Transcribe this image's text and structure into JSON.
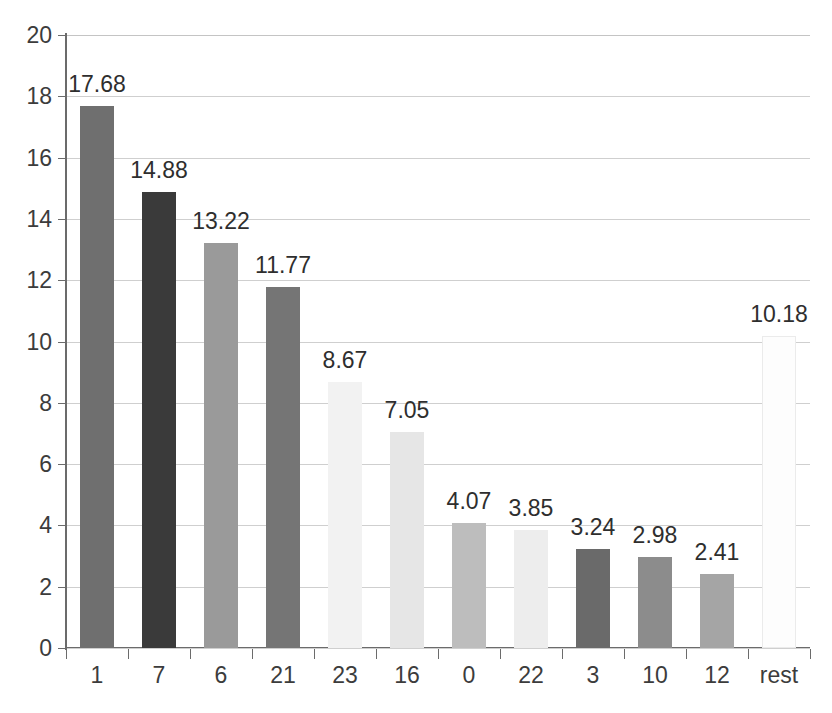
{
  "chart_data": {
    "type": "bar",
    "title": "",
    "subtitle": "",
    "xlabel": "",
    "ylabel": "",
    "categories": [
      "1",
      "7",
      "6",
      "21",
      "23",
      "16",
      "0",
      "22",
      "3",
      "10",
      "12",
      "rest"
    ],
    "values": [
      17.68,
      14.88,
      13.22,
      11.77,
      8.67,
      7.05,
      4.07,
      3.85,
      3.24,
      2.98,
      2.41,
      10.18
    ],
    "value_labels": [
      "17.68",
      "14.88",
      "13.22",
      "11.77",
      "8.67",
      "7.05",
      "4.07",
      "3.85",
      "3.24",
      "2.98",
      "2.41",
      "10.18"
    ],
    "bar_colors": [
      "#6f6f6f",
      "#3a3a3a",
      "#9a9a9a",
      "#757575",
      "#f2f2f2",
      "#e6e6e6",
      "#bdbdbd",
      "#ededed",
      "#6a6a6a",
      "#8c8c8c",
      "#a5a5a5",
      "#fdfdfd"
    ],
    "ylim": [
      0,
      20
    ],
    "ytick_values": [
      0,
      2,
      4,
      6,
      8,
      10,
      12,
      14,
      16,
      18,
      20
    ],
    "ytick_labels": [
      "0",
      "2",
      "4",
      "6",
      "8",
      "10",
      "12",
      "14",
      "16",
      "18",
      "20"
    ],
    "grid": true,
    "grid_axis": "y",
    "legend": false,
    "legend_position": "none",
    "data_labels": true,
    "data_label_position": "outside-end",
    "background_color": "#ffffff",
    "gridline_color": "#cfcfcf",
    "axis_color": "#6b6b6b",
    "text_color": "#3c3c3c"
  }
}
